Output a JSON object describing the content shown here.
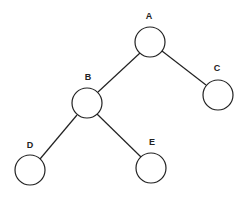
{
  "diagram": {
    "type": "binary-tree",
    "colors": {
      "stroke": "#222222",
      "fill": "#ffffff",
      "background": "#ffffff"
    },
    "nodes": [
      {
        "id": "A",
        "label": "A",
        "cx": 150,
        "cy": 42,
        "r": 15,
        "lx": 149,
        "ly": 19
      },
      {
        "id": "B",
        "label": "B",
        "cx": 87,
        "cy": 103,
        "r": 15,
        "lx": 88,
        "ly": 80
      },
      {
        "id": "C",
        "label": "C",
        "cx": 218,
        "cy": 95,
        "r": 15,
        "lx": 217,
        "ly": 71
      },
      {
        "id": "D",
        "label": "D",
        "cx": 30,
        "cy": 170,
        "r": 15,
        "lx": 30,
        "ly": 148
      },
      {
        "id": "E",
        "label": "E",
        "cx": 151,
        "cy": 168,
        "r": 15,
        "lx": 152,
        "ly": 145
      }
    ],
    "edges": [
      {
        "from": "A",
        "to": "B",
        "x1": 140,
        "y1": 53,
        "x2": 98,
        "y2": 92
      },
      {
        "from": "A",
        "to": "C",
        "x1": 162,
        "y1": 51,
        "x2": 206,
        "y2": 85
      },
      {
        "from": "B",
        "to": "D",
        "x1": 77,
        "y1": 115,
        "x2": 40,
        "y2": 159
      },
      {
        "from": "B",
        "to": "E",
        "x1": 97,
        "y1": 114,
        "x2": 141,
        "y2": 157
      }
    ]
  }
}
